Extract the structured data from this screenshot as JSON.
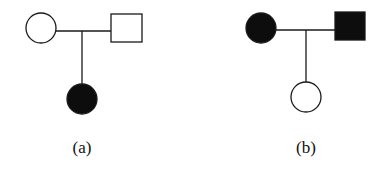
{
  "colors": {
    "stroke": "#1a1a1a",
    "affected": "#0d0d0d",
    "unaffected": "#ffffff"
  },
  "pedigrees": [
    {
      "label": "(a)",
      "mother": {
        "shape": "circle",
        "affected": false
      },
      "father": {
        "shape": "square",
        "affected": false
      },
      "child": {
        "shape": "circle",
        "affected": true
      }
    },
    {
      "label": "(b)",
      "mother": {
        "shape": "circle",
        "affected": true
      },
      "father": {
        "shape": "square",
        "affected": true
      },
      "child": {
        "shape": "circle",
        "affected": false
      }
    }
  ]
}
